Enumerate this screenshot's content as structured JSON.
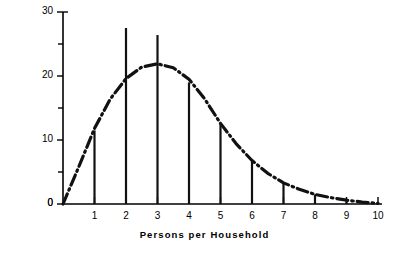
{
  "chart_data": {
    "type": "bar",
    "title": "",
    "subtitle": "",
    "xlabel": "Persons per Household",
    "ylabel": "% of Households",
    "categories": [
      "1",
      "2",
      "3",
      "4",
      "5",
      "6",
      "7",
      "8",
      "9",
      "10"
    ],
    "values": [
      11.5,
      27.5,
      26.4,
      19.0,
      12.5,
      6.7,
      3.4,
      1.5,
      0.5,
      0.2
    ],
    "xlim": [
      0,
      10
    ],
    "ylim": [
      0,
      30
    ],
    "xticks": [
      "1",
      "2",
      "3",
      "4",
      "5",
      "6",
      "7",
      "8",
      "9",
      "10"
    ],
    "yticks": [
      "0",
      "5",
      "10",
      "15",
      "20",
      "25",
      "30"
    ],
    "ytick_labels_shown": [
      "0",
      "10",
      "20",
      "30"
    ],
    "grid": false,
    "legend": false,
    "legend_position": "none",
    "series": [
      {
        "name": "Households (bars)",
        "style": "vertical-line-bars",
        "values": [
          11.5,
          27.5,
          26.4,
          19.0,
          12.5,
          6.7,
          3.4,
          1.5,
          0.5,
          0.2
        ]
      },
      {
        "name": "Smoothed distribution curve",
        "style": "dash-dot",
        "x": [
          0.0,
          0.5,
          1.0,
          1.5,
          2.0,
          2.5,
          3.0,
          3.5,
          4.0,
          4.5,
          5.0,
          5.5,
          6.0,
          6.5,
          7.0,
          7.5,
          8.0,
          8.5,
          9.0,
          9.5,
          10.0
        ],
        "y": [
          0.0,
          5.8,
          11.8,
          16.4,
          19.6,
          21.4,
          21.9,
          21.3,
          19.5,
          16.4,
          12.6,
          9.4,
          6.8,
          4.8,
          3.3,
          2.3,
          1.5,
          1.0,
          0.6,
          0.3,
          0.1
        ]
      }
    ],
    "annotations": []
  },
  "axis": {
    "y_axis_title": "% of Households",
    "x_axis_title": "Persons per Household"
  },
  "colors": {
    "ink": "#000000",
    "background": "#ffffff",
    "curve": "#111111",
    "bars": "#111111"
  }
}
